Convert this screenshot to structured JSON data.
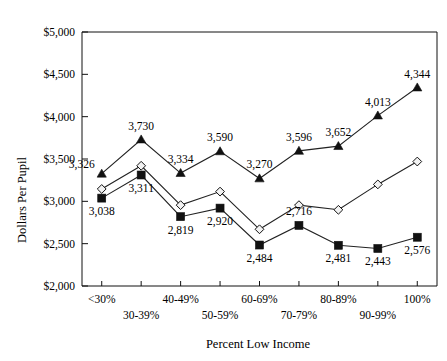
{
  "chart_data": {
    "type": "line",
    "title": "",
    "xlabel": "Percent Low Income",
    "ylabel": "Dollars Per Pupil",
    "categories": [
      "<30%",
      "30-39%",
      "40-49%",
      "50-59%",
      "60-69%",
      "70-79%",
      "80-89%",
      "90-99%",
      "100%"
    ],
    "ylim": [
      2000,
      5000
    ],
    "ytick_values": [
      2000,
      2500,
      3000,
      3500,
      4000,
      4500,
      5000
    ],
    "ytick_labels": [
      "$2,000",
      "$2,500",
      "$3,000",
      "$3,500",
      "$4,000",
      "$4,500",
      "$5,000"
    ],
    "grid": false,
    "legend": "none",
    "series": [
      {
        "name": "triangle-series",
        "marker": "triangle",
        "values": [
          3326,
          3730,
          3334,
          3590,
          3270,
          3596,
          3652,
          4013,
          4344
        ],
        "labels": [
          "3,326",
          "3,730",
          "3,334",
          "3,590",
          "3,270",
          "3,596",
          "3,652",
          "4,013",
          "4,344"
        ],
        "label_positions": [
          "left",
          "above",
          "above",
          "above",
          "above",
          "above",
          "above",
          "above",
          "above"
        ]
      },
      {
        "name": "diamond-series",
        "marker": "diamond",
        "values": [
          3146,
          3420,
          2955,
          3115,
          2670,
          2955,
          2900,
          3200,
          3470
        ],
        "labels": [
          "",
          "",
          "",
          "",
          "",
          "",
          "",
          "",
          ""
        ],
        "label_positions": [
          "",
          "",
          "",
          "",
          "",
          "",
          "",
          "",
          ""
        ]
      },
      {
        "name": "square-series",
        "marker": "square",
        "values": [
          3038,
          3311,
          2819,
          2920,
          2484,
          2716,
          2481,
          2443,
          2576
        ],
        "labels": [
          "3,038",
          "3,311",
          "2,819",
          "2,920",
          "2,484",
          "2,716",
          "2,481",
          "2,443",
          "2,576"
        ],
        "label_positions": [
          "below",
          "below",
          "below",
          "below",
          "below",
          "above",
          "below",
          "below",
          "below"
        ]
      }
    ]
  },
  "axis": {
    "y_title": "Dollars Per Pupil",
    "x_title": "Percent Low Income"
  }
}
